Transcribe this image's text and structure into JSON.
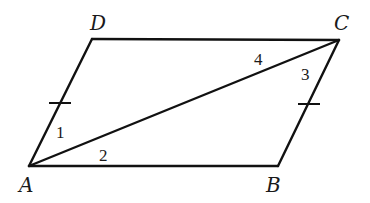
{
  "figure": {
    "type": "parallelogram-with-diagonal",
    "vertices": [
      {
        "name": "A",
        "x": 29,
        "y": 166,
        "label_x": 19,
        "label_y": 192
      },
      {
        "name": "B",
        "x": 278,
        "y": 166,
        "label_x": 266,
        "label_y": 192
      },
      {
        "name": "C",
        "x": 339,
        "y": 40,
        "label_x": 334,
        "label_y": 30
      },
      {
        "name": "D",
        "x": 92,
        "y": 39,
        "label_x": 90,
        "label_y": 30
      }
    ],
    "angle_labels": [
      {
        "text": "1",
        "x": 56,
        "y": 138
      },
      {
        "text": "2",
        "x": 99,
        "y": 161
      },
      {
        "text": "3",
        "x": 301,
        "y": 80
      },
      {
        "text": "4",
        "x": 254,
        "y": 65
      }
    ],
    "diagonal": "AC",
    "congruence_marks": [
      "AD",
      "BC"
    ]
  }
}
